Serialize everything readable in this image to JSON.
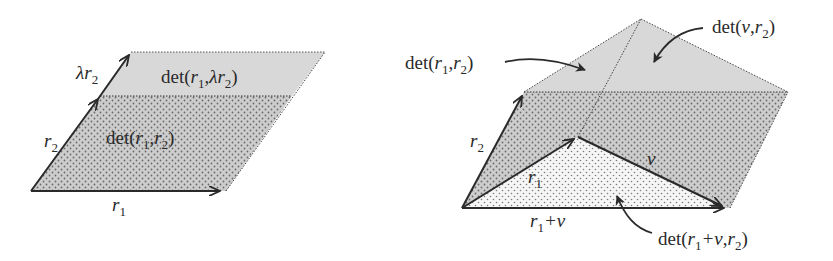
{
  "figure_left": {
    "labels": {
      "lambda_r2": {
        "main": "λr",
        "sub": "2"
      },
      "r2": {
        "main": "r",
        "sub": "2"
      },
      "r1": {
        "main": "r",
        "sub": "1"
      },
      "det_r1_lambda_r2": {
        "pre": "det(",
        "a": "r",
        "a_sub": "1",
        "comma": ",",
        "b": "λr",
        "b_sub": "2",
        "post": ")"
      },
      "det_r1_r2": {
        "pre": "det(",
        "a": "r",
        "a_sub": "1",
        "comma": ",",
        "b": "r",
        "b_sub": "2",
        "post": ")"
      }
    }
  },
  "figure_right": {
    "labels": {
      "r2": {
        "main": "r",
        "sub": "2"
      },
      "r1": {
        "main": "r",
        "sub": "1"
      },
      "v": {
        "main": "v"
      },
      "r1_plus_v": {
        "main": "r",
        "sub": "1",
        "rest": "+v"
      },
      "det_r1_r2": {
        "pre": "det(",
        "a": "r",
        "a_sub": "1",
        "comma": ",",
        "b": "r",
        "b_sub": "2",
        "post": ")"
      },
      "det_v_r2": {
        "pre": "det(",
        "a": "v",
        "comma": ",",
        "b": "r",
        "b_sub": "2",
        "post": ")"
      },
      "det_r1_plus_v_r2": {
        "pre": "det(",
        "a": "r",
        "a_sub": "1",
        "a_rest": "+v",
        "comma": ",",
        "b": "r",
        "b_sub": "2",
        "post": ")"
      }
    }
  },
  "colors": {
    "light_fill": "#d9d9d9",
    "dotted_fill_bg": "#cfcfcf",
    "white_dotted_bg": "#f4f4f4",
    "ink": "#2a2a2a"
  }
}
